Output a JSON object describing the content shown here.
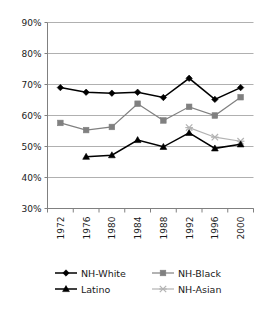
{
  "chart_data": {
    "type": "line",
    "title": "",
    "xlabel": "",
    "ylabel": "",
    "categories": [
      "1972",
      "1976",
      "1980",
      "1984",
      "1988",
      "1992",
      "1996",
      "2000"
    ],
    "ylim": [
      30,
      90
    ],
    "ytick_labels": [
      "90%",
      "80%",
      "70%",
      "60%",
      "50%",
      "40%",
      "30%"
    ],
    "ytick_values": [
      90,
      80,
      70,
      60,
      50,
      40,
      30
    ],
    "grid": true,
    "legend_position": "bottom",
    "series": [
      {
        "name": "NH-White",
        "marker": "diamond",
        "color": "#000000",
        "values": [
          69.0,
          67.5,
          67.2,
          67.5,
          65.8,
          72.0,
          65.2,
          69.0
        ]
      },
      {
        "name": "NH-Black",
        "marker": "square",
        "color": "#808080",
        "values": [
          57.6,
          55.3,
          56.3,
          63.8,
          58.4,
          62.8,
          60.0,
          65.9
        ]
      },
      {
        "name": "Latino",
        "marker": "triangle",
        "color": "#000000",
        "values": [
          null,
          46.7,
          47.2,
          52.1,
          49.9,
          54.4,
          49.4,
          50.7
        ]
      },
      {
        "name": "NH-Asian",
        "marker": "cross",
        "color": "#b3b3b3",
        "values": [
          null,
          null,
          null,
          null,
          null,
          56.1,
          53.0,
          51.7
        ]
      }
    ]
  },
  "legend": {
    "entries": [
      {
        "label": "NH-White"
      },
      {
        "label": "NH-Black"
      },
      {
        "label": "Latino"
      },
      {
        "label": "NH-Asian"
      }
    ]
  },
  "colors": {
    "axis": "#808080",
    "grid": "#b0b0b0",
    "background": "#ffffff",
    "text": "#1a1a1a"
  }
}
